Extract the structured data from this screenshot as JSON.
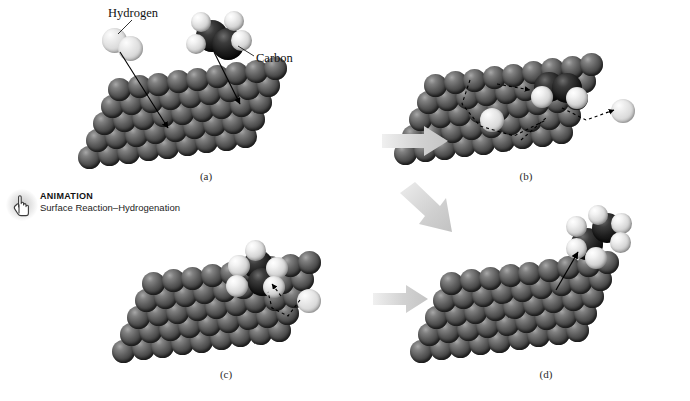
{
  "figure": {
    "background_color": "#ffffff",
    "panels": [
      {
        "id": "a",
        "caption": "(a)",
        "description": "Hydrogen molecule and ethylene molecule approach the metal surface"
      },
      {
        "id": "b",
        "caption": "(b)",
        "description": "Molecules adsorb and dissociate; hydrogen atoms diffuse across the surface"
      },
      {
        "id": "c",
        "caption": "(c)",
        "description": "A hydrogen atom adds to the adsorbed hydrocarbon forming an ethyl intermediate"
      },
      {
        "id": "d",
        "caption": "(d)",
        "description": "Ethane molecule desorbs from the metal surface"
      }
    ]
  },
  "labels": {
    "hydrogen": "Hydrogen",
    "carbon": "Carbon"
  },
  "animation": {
    "title": "ANIMATION",
    "subtitle": "Surface Reaction–Hydrogenation",
    "icon": "hand-pointer-icon"
  },
  "colors": {
    "metal_atom": "#5c5c5c",
    "hydrogen_atom": "#e8e8e8",
    "carbon_atom": "#141414",
    "flow_arrow": "#d5d5d5",
    "leader_line": "#000000",
    "dashed_path": "#000000"
  },
  "arrows": {
    "a_to_b": "process-arrow-a-to-b",
    "b_to_c": "process-arrow-b-to-c",
    "c_to_d": "process-arrow-c-to-d"
  }
}
